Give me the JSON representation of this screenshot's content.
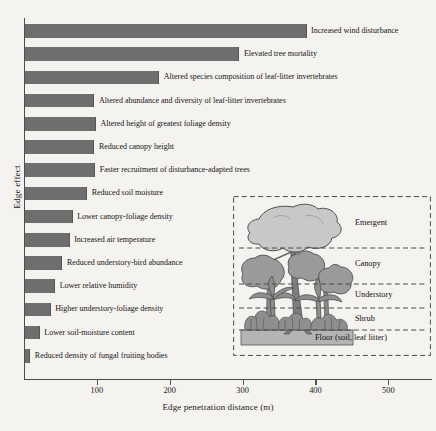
{
  "chart_data": {
    "type": "bar",
    "orientation": "horizontal",
    "title": "",
    "xlabel": "Edge penetration distance (m)",
    "ylabel": "Edge effect",
    "xlim": [
      0,
      560
    ],
    "xticks": [
      100,
      200,
      300,
      400,
      500
    ],
    "grid": false,
    "legend": "none",
    "bar_color": "#6e6e6e",
    "categories": [
      "Increased wind disturbance",
      "Elevated tree mortality",
      "Altered species composition of leaf-litter invertebrates",
      "Altered abundance and diversity of leaf-litter invertebrates",
      "Altered height of greatest foliage density",
      "Reduced canopy height",
      "Faster recruitment of disturbance-adapted trees",
      "Reduced soil moisture",
      "Lower canopy-foliage density",
      "Increased air temperature",
      "Reduced understory-bird abundance",
      "Lower relative humidity",
      "Higher understory-foliage density",
      "Lower soil-moisture content",
      "Reduced density of fungal fruiting bodies"
    ],
    "values": [
      385,
      293,
      183,
      94,
      96,
      94,
      95,
      84,
      64,
      60,
      50,
      40,
      34,
      19,
      6
    ],
    "units": "m"
  },
  "axis": {
    "ylabel": "Edge effect",
    "xlabel": "Edge penetration distance (m)",
    "ticks": [
      {
        "value": 100,
        "label": "100"
      },
      {
        "value": 200,
        "label": "200"
      },
      {
        "value": 300,
        "label": "300"
      },
      {
        "value": 400,
        "label": "400"
      },
      {
        "value": 500,
        "label": "500"
      }
    ]
  },
  "inset": {
    "name": "forest-stratification-diagram",
    "strata": [
      {
        "key": "emergent",
        "label": "Emergent"
      },
      {
        "key": "canopy",
        "label": "Canopy"
      },
      {
        "key": "understory",
        "label": "Understory"
      },
      {
        "key": "shrub",
        "label": "Shrub"
      },
      {
        "key": "floor",
        "label": "Floor (soil, leaf litter)"
      }
    ],
    "colors": {
      "emergent_crown": "#c8c8c8",
      "canopy_crown": "#9a9a9a",
      "trunk": "#7d7d7d",
      "shrub": "#8e8e8e",
      "floor": "#b4b4b4",
      "dashed_line": "#4a4a4a"
    }
  }
}
